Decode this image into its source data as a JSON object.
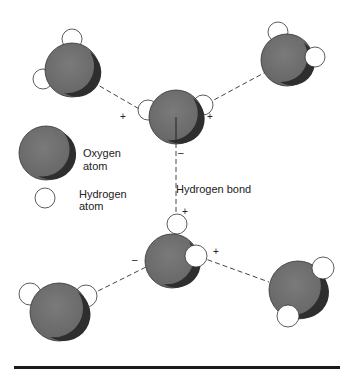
{
  "legend": {
    "oxygen_line1": "Oxygen",
    "oxygen_line2": "atom",
    "hydrogen_line1": "Hydrogen",
    "hydrogen_line2": "atom"
  },
  "bond_label": "Hydrogen bond",
  "charges": {
    "plus": "+",
    "minus": "–"
  },
  "colors": {
    "oxygen_fill": "#6e6e6e",
    "oxygen_shadow": "#2e2e2e",
    "hydrogen_fill": "#ffffff",
    "outline": "#333333",
    "bond_dash": "#444444",
    "baseline_bar": "#1a1a1a"
  }
}
